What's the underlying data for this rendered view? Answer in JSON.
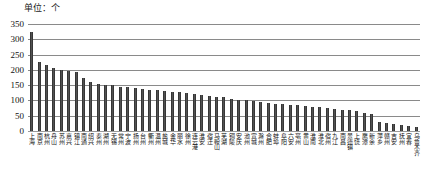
{
  "chart_data": {
    "type": "bar",
    "title": "单位：个",
    "xlabel": "",
    "ylabel": "",
    "ylim": [
      0,
      350
    ],
    "yticks": [
      0,
      50,
      100,
      150,
      200,
      250,
      300,
      350
    ],
    "grid": true,
    "legend": "none",
    "orientation": "vertical",
    "bar_color": "#2b2b2b",
    "categories": [
      "上海",
      "南京",
      "杭州",
      "舟山",
      "苏州",
      "嘉兴",
      "镇江",
      "南通",
      "绍兴",
      "泰州",
      "湖州",
      "无锡",
      "常州",
      "宁波",
      "扬州",
      "台州",
      "衢州",
      "温州",
      "盐城",
      "金华",
      "丽水",
      "徐州",
      "连云港",
      "淮安",
      "宿迁",
      "马鞍山",
      "芜湖",
      "铜陵",
      "安庆",
      "池州",
      "宣城",
      "滁州",
      "合肥",
      "蚌埠",
      "阜阳",
      "六安",
      "亳州",
      "黄山",
      "淮南",
      "淮北",
      "宿州",
      "九江",
      "南昌",
      "景德镇",
      "上饶",
      "鹰潭",
      "新余",
      "萍乡",
      "赣州",
      "吉安",
      "抚州",
      "宜春",
      "乌鲁木齐"
    ],
    "values": [
      325,
      225,
      215,
      205,
      200,
      195,
      193,
      175,
      160,
      155,
      152,
      150,
      145,
      143,
      140,
      138,
      135,
      133,
      130,
      128,
      126,
      124,
      120,
      118,
      115,
      112,
      110,
      105,
      103,
      100,
      98,
      95,
      93,
      90,
      88,
      86,
      84,
      82,
      80,
      78,
      75,
      72,
      70,
      68,
      65,
      60,
      55,
      30,
      25,
      22,
      20,
      18,
      12
    ]
  }
}
